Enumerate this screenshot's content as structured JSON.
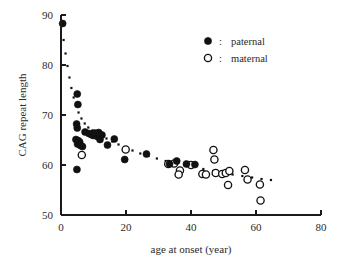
{
  "chart_data": {
    "type": "scatter",
    "title": "",
    "xlabel": "age at onset (year)",
    "ylabel": "CAG repeat length",
    "xlim": [
      0,
      80
    ],
    "ylim": [
      50,
      90
    ],
    "xticks": [
      0,
      20,
      40,
      60,
      80
    ],
    "yticks": [
      50,
      60,
      70,
      80,
      90
    ],
    "grid": false,
    "legend_position": "top-right",
    "legend_separator": ":",
    "series": [
      {
        "name": "paternal",
        "marker": "filled-circle",
        "color": "#111111",
        "points": [
          [
            0.5,
            88.3
          ],
          [
            5.0,
            74.2
          ],
          [
            5.2,
            72.1
          ],
          [
            4.8,
            68.2
          ],
          [
            5.0,
            67.4
          ],
          [
            4.6,
            65.1
          ],
          [
            5.2,
            64.9
          ],
          [
            5.4,
            64.6
          ],
          [
            5.1,
            64.2
          ],
          [
            6.0,
            63.9
          ],
          [
            6.6,
            63.7
          ],
          [
            4.9,
            59.1
          ],
          [
            7.4,
            66.6
          ],
          [
            8.6,
            66.3
          ],
          [
            9.3,
            66.1
          ],
          [
            9.9,
            65.9
          ],
          [
            10.3,
            66.4
          ],
          [
            10.8,
            66.2
          ],
          [
            11.2,
            65.7
          ],
          [
            11.6,
            66.5
          ],
          [
            12.0,
            65.1
          ],
          [
            12.6,
            66.0
          ],
          [
            14.3,
            64.0
          ],
          [
            16.4,
            65.2
          ],
          [
            19.6,
            61.1
          ],
          [
            26.3,
            62.2
          ],
          [
            33.4,
            60.2
          ],
          [
            35.6,
            60.8
          ],
          [
            38.6,
            60.2
          ],
          [
            41.2,
            60.1
          ]
        ]
      },
      {
        "name": "maternal",
        "marker": "open-circle",
        "color": "#111111",
        "points": [
          [
            5.6,
            64.6
          ],
          [
            6.4,
            62.0
          ],
          [
            19.9,
            63.1
          ],
          [
            33.0,
            60.2
          ],
          [
            34.8,
            60.3
          ],
          [
            36.6,
            58.9
          ],
          [
            36.2,
            58.1
          ],
          [
            40.0,
            60.0
          ],
          [
            43.5,
            58.2
          ],
          [
            44.6,
            58.1
          ],
          [
            46.9,
            63.0
          ],
          [
            47.2,
            61.1
          ],
          [
            47.6,
            58.4
          ],
          [
            49.6,
            58.2
          ],
          [
            50.7,
            58.4
          ],
          [
            51.8,
            58.8
          ],
          [
            51.4,
            56.0
          ],
          [
            56.6,
            59.0
          ],
          [
            57.4,
            57.1
          ],
          [
            61.2,
            56.1
          ],
          [
            61.4,
            52.9
          ]
        ]
      }
    ],
    "trend_curve": {
      "style": "dotted",
      "description": "fitted decreasing curve",
      "points": [
        [
          0.8,
          85.0
        ],
        [
          1.4,
          82.3
        ],
        [
          2.0,
          79.8
        ],
        [
          2.6,
          77.5
        ],
        [
          3.2,
          75.4
        ],
        [
          3.9,
          73.5
        ],
        [
          4.6,
          71.9
        ],
        [
          5.4,
          70.5
        ],
        [
          6.3,
          69.3
        ],
        [
          7.3,
          68.3
        ],
        [
          8.4,
          67.5
        ],
        [
          9.6,
          66.9
        ],
        [
          10.9,
          66.4
        ],
        [
          12.4,
          65.9
        ],
        [
          14.0,
          65.3
        ],
        [
          15.8,
          64.7
        ],
        [
          17.7,
          64.1
        ],
        [
          19.8,
          63.5
        ],
        [
          22.0,
          62.9
        ],
        [
          24.4,
          62.3
        ],
        [
          26.9,
          61.8
        ],
        [
          29.5,
          61.3
        ],
        [
          32.2,
          60.8
        ],
        [
          35.0,
          60.4
        ],
        [
          37.9,
          60.0
        ],
        [
          40.8,
          59.6
        ],
        [
          43.8,
          59.2
        ],
        [
          46.8,
          58.8
        ],
        [
          49.8,
          58.4
        ],
        [
          52.8,
          58.1
        ],
        [
          55.8,
          57.8
        ],
        [
          58.8,
          57.5
        ],
        [
          61.7,
          57.2
        ],
        [
          64.6,
          57.0
        ]
      ]
    }
  },
  "legend": {
    "entries": [
      {
        "symbol": "filled-circle",
        "separator": ":",
        "label": "paternal"
      },
      {
        "symbol": "open-circle",
        "separator": ":",
        "label": "maternal"
      }
    ]
  },
  "axes": {
    "x_tick_labels": [
      "0",
      "20",
      "40",
      "60",
      "80"
    ],
    "y_tick_labels": [
      "50",
      "60",
      "70",
      "80",
      "90"
    ],
    "x_axis_title": "age at onset (year)",
    "y_axis_title": "CAG repeat length"
  }
}
